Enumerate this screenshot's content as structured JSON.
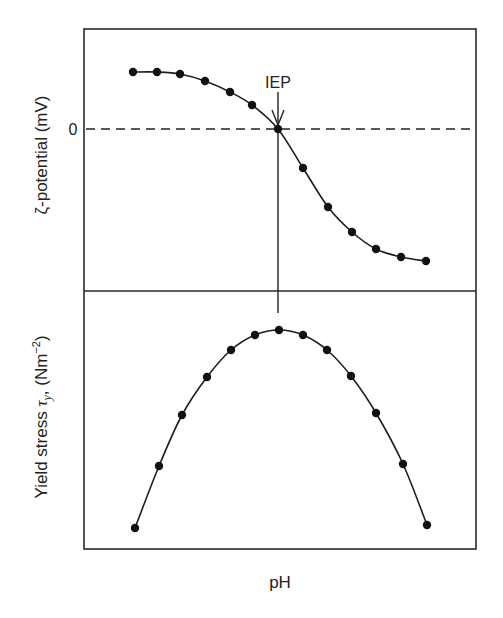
{
  "chart_data": [
    {
      "type": "line",
      "panel": "top",
      "title": "",
      "xlabel": "pH",
      "ylabel": "ζ-potential (mV)",
      "y_ticks": [
        "0"
      ],
      "annotation": {
        "text": "IEP",
        "arrow": "down",
        "at_point_index": 6
      },
      "reference_line": {
        "y": 0,
        "style": "dashed"
      },
      "grid": false,
      "x": [
        1,
        2,
        3,
        4,
        5,
        6,
        7,
        8,
        9,
        10,
        11,
        12,
        13
      ],
      "values": [
        1.0,
        1.0,
        0.97,
        0.87,
        0.72,
        0.53,
        0.0,
        -0.55,
        -1.1,
        -1.45,
        -1.7,
        -1.8,
        -1.85
      ],
      "px": [
        [
          133,
          72
        ],
        [
          157,
          72
        ],
        [
          180,
          74
        ],
        [
          205,
          81
        ],
        [
          230,
          92
        ],
        [
          252,
          105
        ],
        [
          278,
          129
        ],
        [
          303,
          168
        ],
        [
          328,
          207
        ],
        [
          352,
          232
        ],
        [
          376,
          249
        ],
        [
          401,
          257
        ],
        [
          426,
          261
        ]
      ]
    },
    {
      "type": "line",
      "panel": "bottom",
      "title": "",
      "xlabel": "pH",
      "ylabel": "Yield stress τy, (Nm⁻²)",
      "grid": false,
      "x": [
        1,
        2,
        3,
        4,
        5,
        6,
        7,
        8,
        9,
        10,
        11,
        12,
        13
      ],
      "values": [
        0.0,
        0.32,
        0.58,
        0.77,
        0.91,
        0.98,
        1.0,
        0.98,
        0.91,
        0.77,
        0.58,
        0.32,
        0.0
      ],
      "px": [
        [
          135,
          528
        ],
        [
          159,
          466
        ],
        [
          182,
          415
        ],
        [
          207,
          377
        ],
        [
          231,
          350
        ],
        [
          255,
          335
        ],
        [
          279,
          330
        ],
        [
          303,
          335
        ],
        [
          327,
          350
        ],
        [
          351,
          376
        ],
        [
          376,
          413
        ],
        [
          403,
          464
        ],
        [
          427,
          525
        ]
      ]
    }
  ],
  "labels": {
    "top_ylabel": "ζ-potential (mV)",
    "zero_tick": "0",
    "iep": "IEP",
    "bottom_ylabel_main": "Yield stress ",
    "bottom_ylabel_tau": "τ",
    "bottom_ylabel_sub": "y",
    "bottom_ylabel_unit": ", (Nm",
    "bottom_ylabel_exp": "−2",
    "bottom_ylabel_close": ")",
    "xlabel": "pH"
  }
}
